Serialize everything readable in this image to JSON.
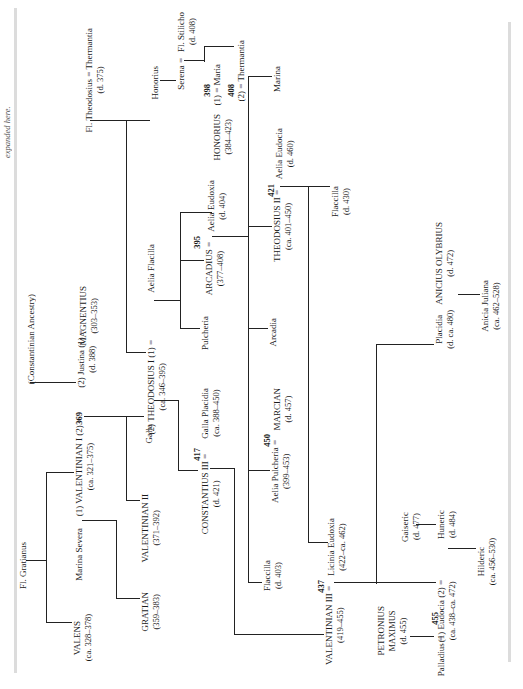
{
  "caption": "expanded here.",
  "ancestry": {
    "constantinian": "(Constantinian Ancestry)",
    "fl_gratianus": "Fl. Gratianus",
    "fl_theodosius": {
      "name": "Fl. Theodosius",
      "sep": "=",
      "spouse": "Thermantia",
      "dates": "(d. 375)"
    }
  },
  "nodes": {
    "valens": {
      "name": "VALENS",
      "dates": "(ca. 328–378)"
    },
    "marina_severa": {
      "name": "Marina Severa"
    },
    "valentinian_i": {
      "name": "(1) VALENTINIAN I (2)",
      "dates": "(ca. 321–375)",
      "year": "369"
    },
    "justina": {
      "name": "(2) Justina (1)",
      "dates": "(d. 388)"
    },
    "magnentius": {
      "name": "MAGNENTIUS",
      "dates": "(303–353)"
    },
    "gratian": {
      "name": "GRATIAN",
      "dates": "(359–383)"
    },
    "valentinian_ii": {
      "name": "VALENTINIAN II",
      "dates": "(371–392)"
    },
    "galla": {
      "name": "Galla"
    },
    "theodosius_i": {
      "name": "(2) THEODOSIUS I (1)",
      "dates": "(ca. 346–395)"
    },
    "aelia_flacilla": {
      "name": "Aelia Flacilla"
    },
    "honorius_elder": {
      "name": "Honorius"
    },
    "serena": {
      "name": "Serena"
    },
    "stilicho": {
      "name": "Fl. Stilicho",
      "dates": "(d. 408)"
    },
    "maria": {
      "name": "(1) =  Maria",
      "year": "398"
    },
    "thermantia": {
      "name": "(2) =  Thermantia",
      "year": "408"
    },
    "honorius": {
      "name": "HONORIUS",
      "dates": "(384–423)"
    },
    "arcadius": {
      "name": "ARCADIUS",
      "dates": "(377–408)",
      "year": "395"
    },
    "aelia_eudoxia": {
      "name": "Aelia Eudoxia",
      "dates": "(d. 404)"
    },
    "pulcheria_sr": {
      "name": "Pulcheria"
    },
    "constantius_iii": {
      "name": "CONSTANTIUS III",
      "dates": "(d. 421)",
      "year": "417"
    },
    "galla_placidia": {
      "name": "Galla Placidia",
      "dates": "(ca. 388–450)"
    },
    "marina": {
      "name": "Marina"
    },
    "theodosius_ii": {
      "name": "THEODOSIUS II",
      "dates": "(ca. 401–450)",
      "year": "421"
    },
    "aelia_eudocia": {
      "name": "Aelia Eudocia",
      "dates": "(d. 460)"
    },
    "flaccilla_430": {
      "name": "Flaccilla",
      "dates": "(d. 430)"
    },
    "arcadia": {
      "name": "Arcadia"
    },
    "aelia_pulcheria": {
      "name": "Aelia Pulcheria",
      "dates": "(399–453)",
      "year": "450"
    },
    "marcian": {
      "name": "MARCIAN",
      "dates": "(d. 457)"
    },
    "flaccilla_403": {
      "name": "Flaccilla",
      "dates": "(d. 403)"
    },
    "valentinian_iii": {
      "name": "VALENTINIAN III",
      "dates": "(419–455)",
      "year": "437"
    },
    "licinia_eudoxia": {
      "name": "Licinia Eudoxia",
      "dates": "(422–ca. 462)"
    },
    "placidia": {
      "name": "Placidia",
      "dates": "(d. ca. 480)"
    },
    "anicius_olybrius": {
      "name": "ANICIUS OLYBRIUS",
      "dates": "(d. 472)"
    },
    "anicia_juliana": {
      "name": "Anicia Juliana",
      "dates": "(ca. 462–528)"
    },
    "gaiseric": {
      "name": "Gaiseric",
      "dates": "(d. 477)"
    },
    "huneric": {
      "name": "Huneric",
      "dates": "(d. 484)"
    },
    "eudocia": {
      "name": "(1) Eudocia (2)",
      "dates": "(ca. 438–ca. 472)"
    },
    "hilderic": {
      "name": "Hilderic",
      "dates": "(ca. 456–530)"
    },
    "petronius_maximus": {
      "line1": "PETRONIUS",
      "line2": "MAXIMUS",
      "dates": "(d. 455)"
    },
    "palladius": {
      "name": "Palladius",
      "year": "455"
    }
  },
  "marriage_sign": "="
}
